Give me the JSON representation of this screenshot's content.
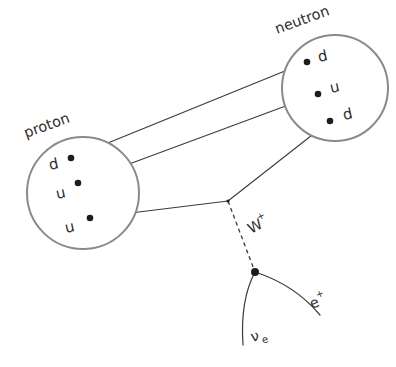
{
  "diagram": {
    "colors": {
      "background": "#ffffff",
      "circle_stroke": "#8a8a8a",
      "line_stroke": "#3a3a3a",
      "dot_fill": "#1d1d1d",
      "text": "#2e2e2e"
    },
    "hadrons": [
      {
        "name": "proton",
        "label": "proton",
        "center": {
          "x": 83,
          "y": 193
        },
        "radius": 56,
        "label_position": {
          "x": 26,
          "y": 138
        },
        "label_rotation": -20,
        "quarks": [
          {
            "symbol": "d",
            "dot": {
              "x": 71,
              "y": 158
            },
            "label_position": {
              "x": 50,
              "y": 170
            }
          },
          {
            "symbol": "u",
            "dot": {
              "x": 78,
              "y": 183
            },
            "label_position": {
              "x": 57,
              "y": 199
            }
          },
          {
            "symbol": "u",
            "dot": {
              "x": 90,
              "y": 218
            },
            "label_position": {
              "x": 66,
              "y": 233
            }
          }
        ]
      },
      {
        "name": "neutron",
        "label": "neutron",
        "center": {
          "x": 335,
          "y": 88
        },
        "radius": 53,
        "label_position": {
          "x": 277,
          "y": 34
        },
        "label_rotation": -20,
        "quarks": [
          {
            "symbol": "d",
            "dot": {
              "x": 307,
              "y": 62
            },
            "label_position": {
              "x": 319,
              "y": 62
            }
          },
          {
            "symbol": "u",
            "dot": {
              "x": 318,
              "y": 94
            },
            "label_position": {
              "x": 331,
              "y": 93
            }
          },
          {
            "symbol": "d",
            "dot": {
              "x": 330,
              "y": 121
            },
            "label_position": {
              "x": 344,
              "y": 120
            }
          }
        ]
      }
    ],
    "vertices": [
      {
        "name": "weak-vertex-upper",
        "x": 228,
        "y": 201
      },
      {
        "name": "weak-vertex-lower",
        "x": 255,
        "y": 272
      }
    ],
    "quark_lines": [
      {
        "name": "spectator-d-line",
        "from": {
          "x": 71,
          "y": 158
        },
        "to": {
          "x": 307,
          "y": 62
        }
      },
      {
        "name": "spectator-u-line",
        "from": {
          "x": 78,
          "y": 183
        },
        "to": {
          "x": 318,
          "y": 94
        }
      },
      {
        "name": "decaying-u-line",
        "from": {
          "x": 90,
          "y": 218
        },
        "to": {
          "x": 228,
          "y": 201
        }
      },
      {
        "name": "produced-d-line",
        "from": {
          "x": 228,
          "y": 201
        },
        "to": {
          "x": 330,
          "y": 121
        }
      }
    ],
    "boson": {
      "name": "W-boson-line",
      "label": "W",
      "superscript": "+",
      "from": {
        "x": 228,
        "y": 201
      },
      "to": {
        "x": 255,
        "y": 272
      },
      "label_position": {
        "x": 251,
        "y": 234
      },
      "label_rotation": -28
    },
    "leptons": [
      {
        "name": "positron",
        "label": "e",
        "superscript": "+",
        "path": "M 255 272 Q 295 285 320 315",
        "label_position": {
          "x": 312,
          "y": 309
        },
        "label_rotation": -22
      },
      {
        "name": "electron-neutrino",
        "label": "ν",
        "subscript": "e",
        "path": "M 255 272 Q 240 300 243 345",
        "label_position": {
          "x": 252,
          "y": 342
        },
        "label_rotation": -14
      }
    ]
  }
}
